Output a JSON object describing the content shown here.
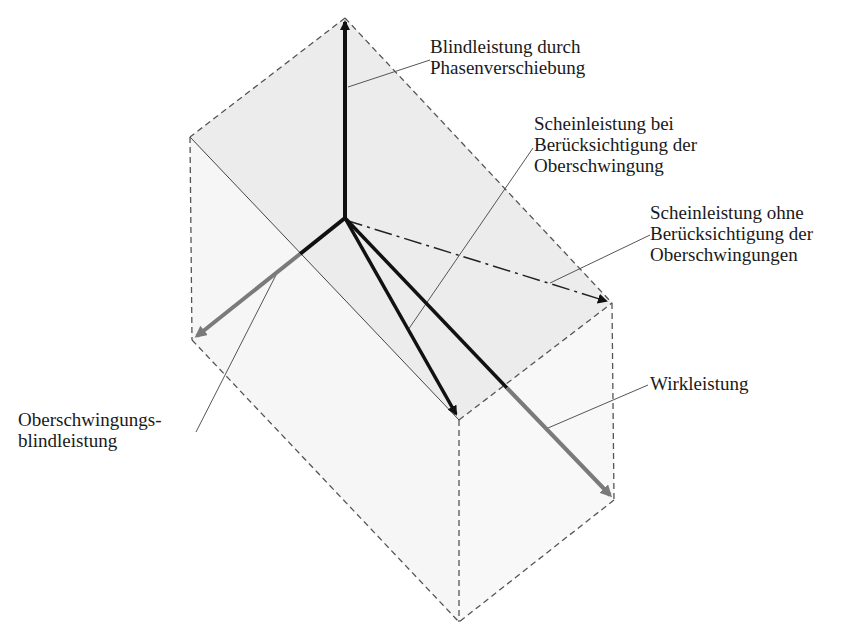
{
  "diagram": {
    "type": "3D power vector diagram",
    "colors": {
      "primary_vector": "#111111",
      "secondary_vector": "#7a7a7a",
      "dashed_edge": "#555555",
      "face_fill": "#ededed",
      "leader_line": "#555555",
      "text": "#1a1a1a"
    },
    "labels": {
      "blindleistung": {
        "line1": "Blindleistung durch",
        "line2": "Phasenverschiebung"
      },
      "schein_mit": {
        "line1": "Scheinleistung bei",
        "line2": "Berücksichtigung der",
        "line3": "Oberschwingung"
      },
      "schein_ohne": {
        "line1": "Scheinleistung ohne",
        "line2": "Berücksichtigung der",
        "line3": "Oberschwingungen"
      },
      "wirkleistung": {
        "line1": "Wirkleistung"
      },
      "oberschwingungsblind": {
        "line1": "Oberschwingungs-",
        "line2": "blindleistung"
      }
    },
    "vectors": [
      {
        "name": "Blindleistung durch Phasenverschiebung",
        "from": [
          345,
          218
        ],
        "to": [
          345,
          18
        ],
        "style": "solid-black"
      },
      {
        "name": "Oberschwingungsblindleistung",
        "from": [
          345,
          218
        ],
        "to": [
          192,
          340
        ],
        "style": "black-then-gray"
      },
      {
        "name": "Wirkleistung",
        "from": [
          345,
          218
        ],
        "to": [
          614,
          500
        ],
        "style": "black-then-gray"
      },
      {
        "name": "Scheinleistung bei Berücksichtigung der Oberschwingung",
        "from": [
          345,
          218
        ],
        "to": [
          459,
          420
        ],
        "style": "solid-black"
      },
      {
        "name": "Scheinleistung ohne Berücksichtigung der Oberschwingungen",
        "from": [
          345,
          218
        ],
        "to": [
          612,
          303
        ],
        "style": "dash-dot"
      }
    ]
  }
}
